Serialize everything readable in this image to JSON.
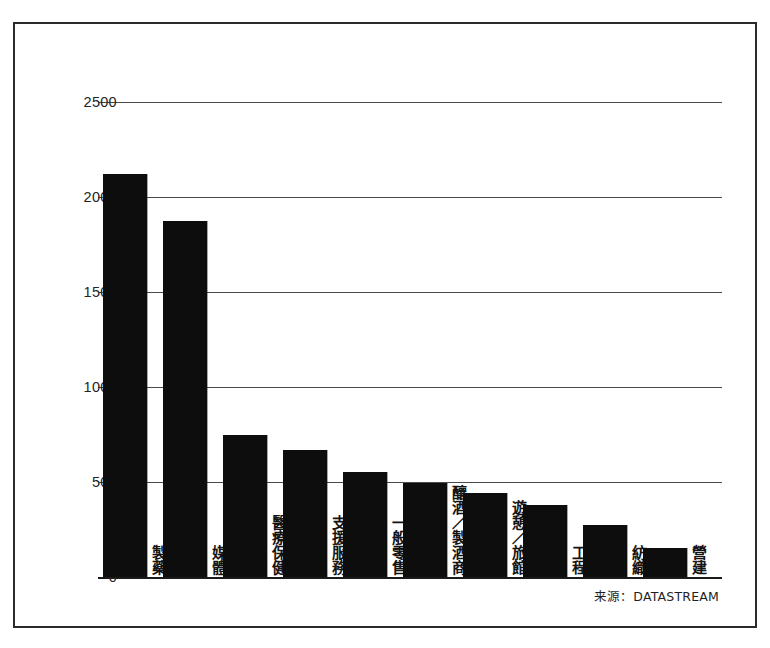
{
  "chart_data": {
    "type": "bar",
    "title": "",
    "subtitle": "",
    "xlabel": "",
    "ylabel": "",
    "ylim": [
      0,
      2500
    ],
    "yticks": [
      0,
      500,
      1000,
      1500,
      2000,
      2500
    ],
    "ytick_labels": [
      "0",
      "500",
      "1000",
      "1500",
      "2000",
      "2500"
    ],
    "grid": true,
    "legend": "none",
    "orientation": "vertical",
    "bar_color": "#0d0d0d",
    "categories": [
      "製藥",
      "媒體",
      "醫療保健",
      "支援服務",
      "一般零售",
      "釀酒／製酒商",
      "遊憩／旅館",
      "工程",
      "紡織",
      "營建"
    ],
    "values": [
      2120,
      1875,
      745,
      670,
      550,
      495,
      440,
      380,
      275,
      155
    ],
    "annotations": {
      "source": "来源：DATASTREAM"
    }
  },
  "figure": {
    "frame_color": "#2b2b2b",
    "background": "#ffffff",
    "axis_color": "#1a1a1a",
    "gridline_color": "#4a4a4a"
  }
}
